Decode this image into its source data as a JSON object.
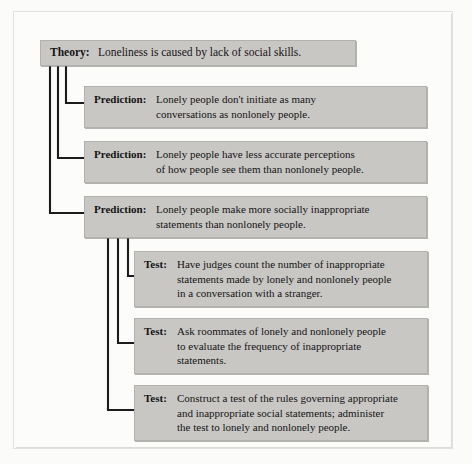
{
  "diagram": {
    "type": "hierarchy-flowchart",
    "theory": {
      "label": "Theory:",
      "text": "Loneliness is caused by lack of social skills."
    },
    "predictions": [
      {
        "label": "Prediction:",
        "lines": [
          "Lonely people don't initiate as many",
          "conversations as nonlonely people."
        ]
      },
      {
        "label": "Prediction:",
        "lines": [
          "Lonely people have less accurate perceptions",
          "of how people see them than nonlonely people."
        ]
      },
      {
        "label": "Prediction:",
        "lines": [
          "Lonely people make more socially inappropriate",
          "statements than nonlonely people."
        ]
      }
    ],
    "tests": [
      {
        "label": "Test:",
        "lines": [
          "Have judges count the number of inappropriate",
          "statements made by lonely and nonlonely people",
          "in a conversation with a stranger."
        ]
      },
      {
        "label": "Test:",
        "lines": [
          "Ask roommates of lonely and nonlonely people",
          "to evaluate the frequency of inappropriate",
          "statements."
        ]
      },
      {
        "label": "Test:",
        "lines": [
          "Construct a test of the rules governing appropriate",
          "and inappropriate social statements; administer",
          "the test to lonely and nonlonely people."
        ]
      }
    ],
    "colors": {
      "box_fill": "#c9c7c4",
      "box_border": "#b3b1ae",
      "connector": "#1c1c1c",
      "page_background": "#fbfbfa",
      "text": "#141414"
    }
  }
}
